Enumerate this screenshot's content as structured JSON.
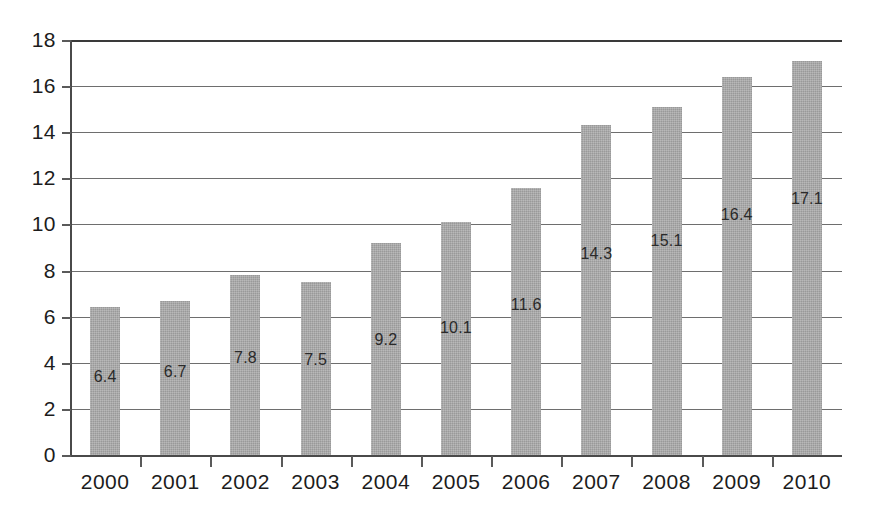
{
  "chart_data": {
    "type": "bar",
    "title": "",
    "subtitle": "",
    "xlabel": "",
    "ylabel": "",
    "categories": [
      "2000",
      "2001",
      "2002",
      "2003",
      "2004",
      "2005",
      "2006",
      "2007",
      "2008",
      "2009",
      "2010"
    ],
    "values": [
      6.4,
      6.7,
      7.8,
      7.5,
      9.2,
      10.1,
      11.6,
      14.3,
      15.1,
      16.4,
      17.1
    ],
    "data_labels": [
      "6.4",
      "6.7",
      "7.8",
      "7.5",
      "9.2",
      "10.1",
      "11.6",
      "14.3",
      "15.1",
      "16.4",
      "17.1"
    ],
    "ylim": [
      0,
      18
    ],
    "ytick_values": [
      0,
      2,
      4,
      6,
      8,
      10,
      12,
      14,
      16,
      18
    ],
    "ytick_labels": [
      "0",
      "2",
      "4",
      "6",
      "8",
      "10",
      "12",
      "14",
      "16",
      "18"
    ],
    "grid": true,
    "grid_axis": "y",
    "legend": false,
    "legend_position": "none",
    "bar_color": "#a9a9a9",
    "gridline_color": "#6e6e6e",
    "axis_color": "#4a4a4a",
    "text_color": "#1c1c1c",
    "background_color": "#ffffff",
    "label_placement": "inside-bar-below-top",
    "label_offsets_units": [
      3.0,
      3.1,
      3.6,
      3.4,
      4.2,
      4.6,
      5.1,
      5.6,
      5.8,
      6.0,
      6.0
    ]
  }
}
